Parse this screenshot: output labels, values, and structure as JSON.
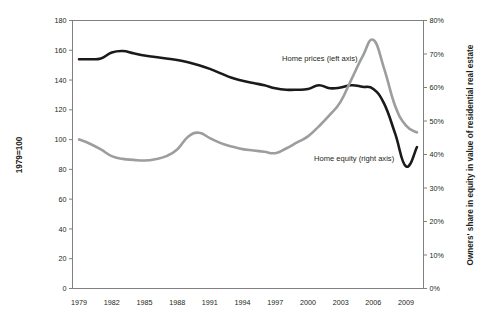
{
  "chart_data": {
    "type": "line",
    "title": "",
    "subtitle": "",
    "xlabel": "",
    "ylabel": "1979=100",
    "ylabel_right": "Owners' share in equity in value of residential real estate",
    "grid": false,
    "legend_position": "inline-annotations",
    "x": [
      1979,
      1980,
      1981,
      1982,
      1983,
      1984,
      1985,
      1986,
      1987,
      1988,
      1989,
      1990,
      1991,
      1992,
      1993,
      1994,
      1995,
      1996,
      1997,
      1998,
      1999,
      2000,
      2001,
      2002,
      2003,
      2004,
      2005,
      2006,
      2007,
      2008,
      2009,
      2010
    ],
    "xtick_labels": [
      "1979",
      "1982",
      "1985",
      "1988",
      "1991",
      "1994",
      "1997",
      "2000",
      "2003",
      "2006",
      "2009"
    ],
    "xtick_values": [
      1979,
      1982,
      1985,
      1988,
      1991,
      1994,
      1997,
      2000,
      2003,
      2006,
      2009
    ],
    "xlim": [
      1978.4,
      2010.6
    ],
    "ylim_left": [
      0,
      180
    ],
    "ytick_left_labels": [
      "0",
      "20",
      "40",
      "60",
      "80",
      "100",
      "120",
      "140",
      "160",
      "180"
    ],
    "ytick_left_values": [
      0,
      20,
      40,
      60,
      80,
      100,
      120,
      140,
      160,
      180
    ],
    "ylim_right": [
      0,
      80
    ],
    "ytick_right_labels": [
      "0%",
      "10%",
      "20%",
      "30%",
      "40%",
      "50%",
      "60%",
      "70%",
      "80%"
    ],
    "ytick_right_values": [
      0,
      10,
      20,
      30,
      40,
      50,
      60,
      70,
      80
    ],
    "series": [
      {
        "name": "Home prices (left axis)",
        "axis": "left",
        "color": "#1a1a1a",
        "width": 2.6,
        "values": [
          154,
          154,
          154.5,
          158.5,
          159.5,
          158,
          156.5,
          155.5,
          154.5,
          153.5,
          152,
          150,
          147.5,
          144.5,
          141.5,
          139.5,
          138,
          136.5,
          134.5,
          133.5,
          133.5,
          134,
          136.5,
          134.5,
          135,
          136.5,
          135.5,
          134,
          124,
          104,
          82,
          95
        ]
      },
      {
        "name": "Home equity (right axis)",
        "axis": "right",
        "color": "#9d9d9d",
        "width": 2.6,
        "values": [
          44.5,
          43.2,
          41.5,
          39.5,
          38.7,
          38.4,
          38.2,
          38.6,
          39.5,
          41.5,
          45.3,
          46.5,
          44.9,
          43.4,
          42.4,
          41.6,
          41.2,
          40.8,
          40.4,
          41.8,
          43.6,
          45.4,
          48.4,
          51.8,
          55.8,
          62.5,
          69.2,
          74.2,
          65.5,
          54.5,
          48.6,
          46.6
        ]
      }
    ],
    "annotations": [
      {
        "text": "Home prices (left axis)",
        "x_px": 282,
        "y_px": 61,
        "anchor": "start"
      },
      {
        "text": "Home equity (right axis)",
        "x_px": 314,
        "y_px": 161,
        "anchor": "start"
      }
    ]
  },
  "axes": {
    "left_title": "1979=100",
    "right_title": "Owners' share in equity in value of residential real estate"
  }
}
